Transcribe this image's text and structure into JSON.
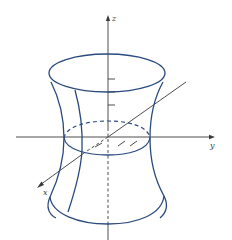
{
  "figure": {
    "axes": {
      "x_label": "x",
      "y_label": "y",
      "z_label": "z"
    },
    "colors": {
      "surface": "#2a4a7e",
      "axes": "#3a3a3a",
      "background": "#ffffff"
    }
  }
}
